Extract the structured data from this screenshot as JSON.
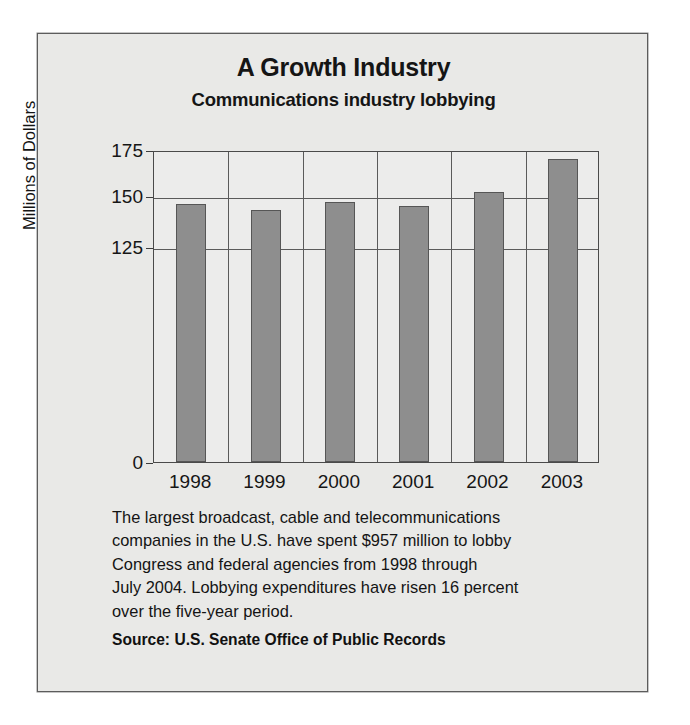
{
  "chart_data": {
    "type": "bar",
    "title": "A Growth Industry",
    "subtitle": "Communications industry lobbying",
    "xlabel": "",
    "ylabel": "Millions of Dollars",
    "categories": [
      "1998",
      "1999",
      "2000",
      "2001",
      "2002",
      "2003"
    ],
    "values": [
      146,
      143,
      147,
      145,
      152,
      170
    ],
    "yticks": [
      "0",
      "125",
      "150",
      "175"
    ],
    "ytick_values": [
      0,
      125,
      150,
      175
    ],
    "ylim": [
      0,
      175
    ],
    "axis_note": "broken axis: baseline 0 sits directly below the 125 gridline",
    "grid": true,
    "legend": null,
    "bar_color": "#8e8e8e",
    "bar_border_color": "#565656",
    "panel_color": "#e9e9e7"
  },
  "caption": {
    "line1": "The largest broadcast, cable and telecommunications",
    "line2": "companies in the U.S. have spent $957 million to lobby",
    "line3": "Congress and federal agencies from 1998 through",
    "line4": "July 2004. Lobbying expenditures have risen 16 percent",
    "line5": "over the five-year period."
  },
  "source": {
    "text": "Source: U.S. Senate Office of Public Records"
  }
}
